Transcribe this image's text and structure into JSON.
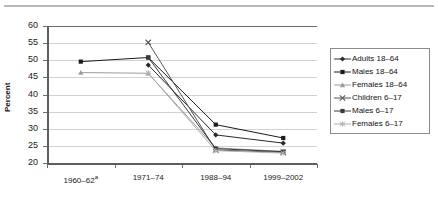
{
  "chart_data": {
    "type": "line",
    "title": "",
    "subtitle": "",
    "xlabel": "",
    "ylabel": "Percent",
    "categories": [
      "1960–62",
      "1971–74",
      "1988–94",
      "1999–2002"
    ],
    "category_labels": [
      "1960–62ᵃ",
      "1971–74",
      "1988–94",
      "1999–2002"
    ],
    "category_footnote_marker": "a",
    "ylim": [
      20,
      60
    ],
    "ytick_values": [
      20,
      25,
      30,
      35,
      40,
      45,
      50,
      55,
      60
    ],
    "ytick_labels": [
      "20",
      "25",
      "30",
      "35",
      "40",
      "45",
      "50",
      "55",
      "60"
    ],
    "grid": true,
    "grid_axis": "y",
    "legend_position": "right",
    "series": [
      {
        "name": "Adults 18–64",
        "marker": "diamond",
        "color": "#2a2a2a",
        "x": [
          "1971–74",
          "1988–94",
          "1999–2002"
        ],
        "values": [
          48.6,
          28.2,
          25.8
        ]
      },
      {
        "name": "Males 18–64",
        "marker": "square",
        "color": "#1c1c1c",
        "x": [
          "1960–62",
          "1971–74",
          "1988–94",
          "1999–2002"
        ],
        "values": [
          49.6,
          50.8,
          31.2,
          27.3
        ]
      },
      {
        "name": "Females 18–64",
        "marker": "triangle",
        "color": "#9c9c9c",
        "x": [
          "1960–62",
          "1971–74",
          "1988–94",
          "1999–2002"
        ],
        "values": [
          46.4,
          46.2,
          24.4,
          23.4
        ]
      },
      {
        "name": "Children 6–17",
        "marker": "cross",
        "color": "#555555",
        "x": [
          "1971–74",
          "1988–94",
          "1999–2002"
        ],
        "values": [
          55.2,
          23.8,
          23.1
        ]
      },
      {
        "name": "Males 6–17",
        "marker": "square",
        "color": "#3a3a3a",
        "x": [
          "1971–74",
          "1988–94",
          "1999–2002"
        ],
        "values": [
          50.8,
          24.2,
          23.3
        ]
      },
      {
        "name": "Females 6–17",
        "marker": "asterisk",
        "color": "#b0b0b0",
        "x": [
          "1971–74",
          "1988–94",
          "1999–2002"
        ],
        "values": [
          46.2,
          23.6,
          22.9
        ]
      }
    ]
  },
  "axis": {
    "y_title": "Percent",
    "y_ticks": [
      "60",
      "55",
      "50",
      "45",
      "40",
      "35",
      "30",
      "25",
      "20"
    ],
    "x_ticks": [
      "1960–62ᵃ",
      "1971–74",
      "1988–94",
      "1999–2002"
    ]
  },
  "legend": {
    "items": [
      {
        "label": "Adults 18–64",
        "marker": "diamond",
        "color": "#2a2a2a"
      },
      {
        "label": "Males 18–64",
        "marker": "square",
        "color": "#1c1c1c"
      },
      {
        "label": "Females 18–64",
        "marker": "triangle",
        "color": "#9c9c9c"
      },
      {
        "label": "Children 6–17",
        "marker": "cross",
        "color": "#555555"
      },
      {
        "label": "Males 6–17",
        "marker": "square",
        "color": "#3a3a3a"
      },
      {
        "label": "Females 6–17",
        "marker": "asterisk",
        "color": "#b0b0b0"
      }
    ]
  },
  "colors": {
    "background": "#ffffff",
    "grid": "#d2d2d2",
    "axis": "#5d5d5d",
    "text": "#1a1a1a",
    "top_rule": "#b9b9b9"
  }
}
